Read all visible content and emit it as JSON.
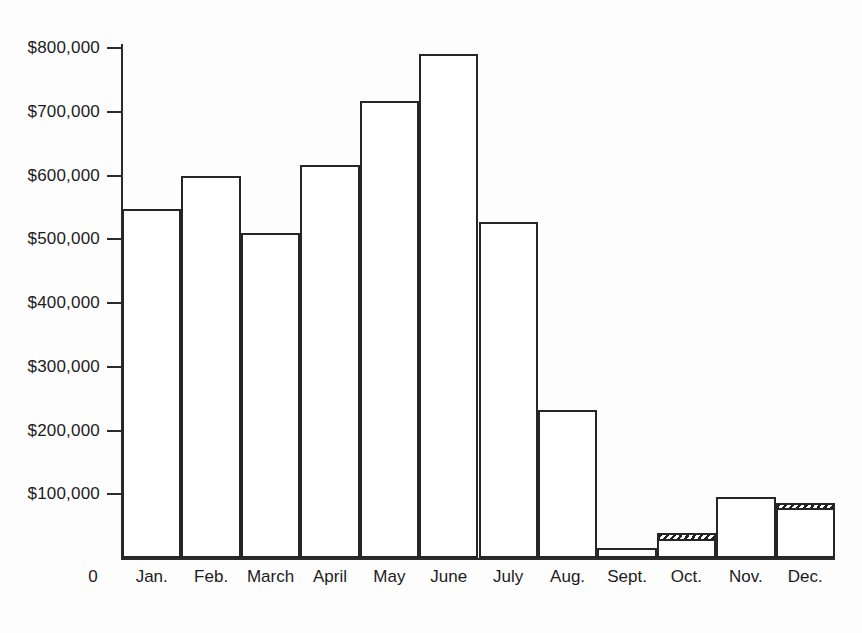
{
  "chart_data": {
    "type": "bar",
    "title": "",
    "xlabel": "",
    "ylabel": "",
    "ylim": [
      0,
      800000
    ],
    "grid": false,
    "legend": null,
    "origin_label": "0",
    "y_ticks": [
      {
        "value": 100000,
        "label": "$100,000"
      },
      {
        "value": 200000,
        "label": "$200,000"
      },
      {
        "value": 300000,
        "label": "$300,000"
      },
      {
        "value": 400000,
        "label": "$400,000"
      },
      {
        "value": 500000,
        "label": "$500,000"
      },
      {
        "value": 600000,
        "label": "$600,000"
      },
      {
        "value": 700000,
        "label": "$700,000"
      },
      {
        "value": 800000,
        "label": "$800,000"
      }
    ],
    "categories": [
      "Jan.",
      "Feb.",
      "March",
      "April",
      "May",
      "June",
      "July",
      "Aug.",
      "Sept.",
      "Oct.",
      "Nov.",
      "Dec."
    ],
    "values": [
      547000,
      600000,
      510000,
      617000,
      717000,
      790000,
      527000,
      232000,
      15000,
      40000,
      95000,
      87000
    ],
    "hatched_segments": [
      {
        "category": "Oct.",
        "index": 9,
        "from": 27000,
        "to": 40000
      },
      {
        "category": "Dec.",
        "index": 11,
        "from": 75000,
        "to": 87000
      }
    ],
    "series": [
      {
        "name": "Monthly amount",
        "values": [
          547000,
          600000,
          510000,
          617000,
          717000,
          790000,
          527000,
          232000,
          15000,
          40000,
          95000,
          87000
        ]
      }
    ],
    "style": {
      "bar_fill": "#ffffff",
      "bar_outline": "#262626",
      "hatch_color": "#1f1f1f",
      "axis_color": "#2b2b2b",
      "background": "#fdfdfd"
    }
  }
}
